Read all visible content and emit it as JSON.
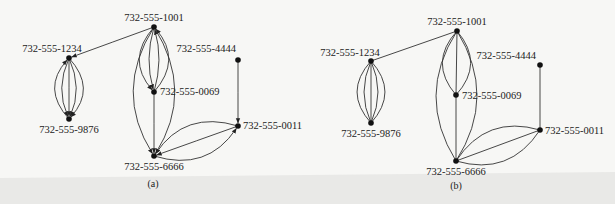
{
  "figures": [
    {
      "id": "a",
      "caption": "(a)",
      "directed": true,
      "nodes": [
        {
          "id": "1001",
          "label": "732-555-1001"
        },
        {
          "id": "1234",
          "label": "732-555-1234"
        },
        {
          "id": "9876",
          "label": "732-555-9876"
        },
        {
          "id": "0069",
          "label": "732-555-0069"
        },
        {
          "id": "4444",
          "label": "732-555-4444"
        },
        {
          "id": "0011",
          "label": "732-555-0011"
        },
        {
          "id": "6666",
          "label": "732-555-6666"
        }
      ],
      "edges": [
        {
          "from": "1001",
          "to": "1234"
        },
        {
          "from": "1234",
          "to": "9876"
        },
        {
          "from": "1234",
          "to": "9876"
        },
        {
          "from": "1234",
          "to": "9876"
        },
        {
          "from": "1234",
          "to": "9876"
        },
        {
          "from": "9876",
          "to": "1234"
        },
        {
          "from": "1001",
          "to": "0069"
        },
        {
          "from": "1001",
          "to": "0069"
        },
        {
          "from": "0069",
          "to": "1001"
        },
        {
          "from": "0069",
          "to": "1001"
        },
        {
          "from": "1001",
          "to": "6666"
        },
        {
          "from": "1001",
          "to": "6666"
        },
        {
          "from": "0069",
          "to": "6666"
        },
        {
          "from": "4444",
          "to": "0011"
        },
        {
          "from": "6666",
          "to": "0011"
        },
        {
          "from": "0011",
          "to": "6666"
        },
        {
          "from": "0011",
          "to": "6666"
        }
      ]
    },
    {
      "id": "b",
      "caption": "(b)",
      "directed": false,
      "nodes": [
        {
          "id": "1001",
          "label": "732-555-1001"
        },
        {
          "id": "1234",
          "label": "732-555-1234"
        },
        {
          "id": "9876",
          "label": "732-555-9876"
        },
        {
          "id": "0069",
          "label": "732-555-0069"
        },
        {
          "id": "4444",
          "label": "732-555-4444"
        },
        {
          "id": "0011",
          "label": "732-555-0011"
        },
        {
          "id": "6666",
          "label": "732-555-6666"
        }
      ],
      "edges": [
        {
          "from": "1001",
          "to": "1234"
        },
        {
          "from": "1234",
          "to": "9876"
        },
        {
          "from": "1234",
          "to": "9876"
        },
        {
          "from": "1234",
          "to": "9876"
        },
        {
          "from": "1234",
          "to": "9876"
        },
        {
          "from": "1234",
          "to": "9876"
        },
        {
          "from": "1001",
          "to": "0069"
        },
        {
          "from": "1001",
          "to": "0069"
        },
        {
          "from": "1001",
          "to": "0069"
        },
        {
          "from": "1001",
          "to": "6666"
        },
        {
          "from": "1001",
          "to": "6666"
        },
        {
          "from": "0069",
          "to": "6666"
        },
        {
          "from": "4444",
          "to": "0011"
        },
        {
          "from": "6666",
          "to": "0011"
        },
        {
          "from": "6666",
          "to": "0011"
        },
        {
          "from": "6666",
          "to": "0011"
        }
      ]
    }
  ]
}
